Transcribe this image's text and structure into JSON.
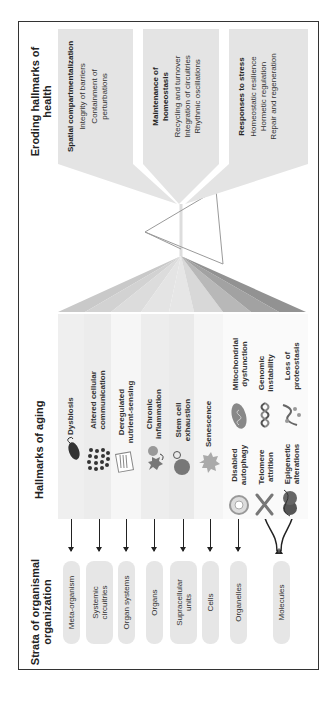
{
  "strata": {
    "title": "Strata of organismal organization",
    "items": [
      {
        "label": "Meta-organism"
      },
      {
        "label": "Systemic circuitries"
      },
      {
        "label": "Organ systems"
      },
      {
        "label": "Organs"
      },
      {
        "label": "Supracellular units"
      },
      {
        "label": "Cells"
      },
      {
        "label": "Organelles"
      },
      {
        "label": "Molecules"
      }
    ]
  },
  "hallmarks_aging": {
    "title": "Hallmarks of aging",
    "items": [
      {
        "label": "Dysbiosis",
        "icon": "bacterium-icon"
      },
      {
        "label": "Altered cellular communication",
        "icon": "cell-cluster-icon"
      },
      {
        "label": "Deregulated nutrient-sensing",
        "icon": "membrane-receptor-icon"
      },
      {
        "label": "Chronic inflammation",
        "icon": "immune-cell-icon"
      },
      {
        "label": "Stem cell exhaustion",
        "icon": "stem-cell-icon"
      },
      {
        "label": "Senescence",
        "icon": "senescent-cell-icon"
      },
      {
        "label": "Disabled autophagy",
        "icon": "autophagosome-icon"
      },
      {
        "label": "Mitochondrial dysfunction",
        "icon": "mitochondrion-icon"
      },
      {
        "label": "Telomere attrition",
        "icon": "chromosome-icon"
      },
      {
        "label": "Genomic instability",
        "icon": "dna-helix-icon"
      },
      {
        "label": "Epigenetic alterations",
        "icon": "nucleosome-icon"
      },
      {
        "label": "Loss of proteostasis",
        "icon": "protein-icon"
      }
    ]
  },
  "hallmarks_health": {
    "title": "Eroding hallmarks of health",
    "groups": [
      {
        "heading": "Spatial compartmentalization",
        "items": [
          "Integrity of barriers",
          "Containment of perturbations"
        ]
      },
      {
        "heading": "Maintenance of homeostasis",
        "items": [
          "Recycling and turnover",
          "Integration of circuitries",
          "Rhythmic oscillations"
        ]
      },
      {
        "heading": "Responses to stress",
        "items": [
          "Homeostatic resilience",
          "Hormetic regulation",
          "Repair and regeneration"
        ]
      }
    ]
  },
  "colors": {
    "frame": "#333333",
    "pill_fill": "#e6e6e6",
    "box_fill": "#e4e4e4",
    "fan_light": "#e8e8e8",
    "fan_dark": "#8c8c8c",
    "triangle_stroke": "#9a9a9a"
  }
}
